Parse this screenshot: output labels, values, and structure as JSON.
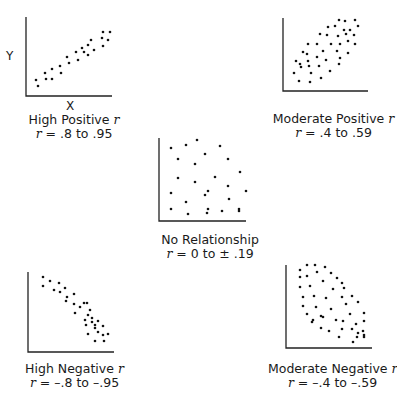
{
  "axis_labels": {
    "y": "Y",
    "x": "X"
  },
  "panels": [
    {
      "id": "high-positive",
      "title": "High Positive",
      "r_symbol": "r",
      "range_prefix": "r",
      "range_text": "=  .8 to .95"
    },
    {
      "id": "moderate-positive",
      "title": "Moderate Positive",
      "r_symbol": "r",
      "range_prefix": "r",
      "range_text": "=  .4 to .59"
    },
    {
      "id": "no-relationship",
      "title": "No Relationship",
      "r_symbol": "",
      "range_prefix": "r",
      "range_text": "=  0 to ± .19"
    },
    {
      "id": "high-negative",
      "title": "High Negative",
      "r_symbol": "r",
      "range_prefix": "r",
      "range_text": "=  –.8 to –.95"
    },
    {
      "id": "moderate-negative",
      "title": "Moderate Negative",
      "r_symbol": "r",
      "range_prefix": "r",
      "range_text": "=  –.4 to –.59"
    }
  ],
  "chart_data": [
    {
      "type": "scatter",
      "title": "High Positive r",
      "subtitle": "r = .8 to .95",
      "xlabel": "X",
      "ylabel": "Y",
      "grid": false,
      "axes": {
        "x0": 26,
        "y0": 96,
        "top": 17,
        "right": 112
      },
      "points": [
        [
          36,
          80
        ],
        [
          38,
          86
        ],
        [
          45,
          73
        ],
        [
          46,
          79
        ],
        [
          52,
          69
        ],
        [
          52,
          79
        ],
        [
          60,
          66
        ],
        [
          61,
          73
        ],
        [
          67,
          57
        ],
        [
          69,
          63
        ],
        [
          76,
          52
        ],
        [
          78,
          60
        ],
        [
          82,
          48
        ],
        [
          84,
          52
        ],
        [
          88,
          45
        ],
        [
          88,
          55
        ],
        [
          91,
          40
        ],
        [
          94,
          50
        ],
        [
          102,
          38
        ],
        [
          103,
          32
        ],
        [
          103,
          46
        ],
        [
          108,
          40
        ],
        [
          110,
          32
        ]
      ]
    },
    {
      "type": "scatter",
      "title": "Moderate Positive r",
      "subtitle": "r = .4 to .59",
      "xlabel": "",
      "ylabel": "",
      "grid": false,
      "axes": {
        "x0": 283,
        "y0": 91,
        "top": 18,
        "right": 368
      },
      "points": [
        [
          339,
          20
        ],
        [
          345,
          21
        ],
        [
          355,
          20
        ],
        [
          328,
          27
        ],
        [
          335,
          26
        ],
        [
          344,
          30
        ],
        [
          350,
          30
        ],
        [
          358,
          26
        ],
        [
          320,
          34
        ],
        [
          327,
          35
        ],
        [
          338,
          36
        ],
        [
          346,
          34
        ],
        [
          354,
          35
        ],
        [
          308,
          44
        ],
        [
          317,
          44
        ],
        [
          331,
          44
        ],
        [
          340,
          44
        ],
        [
          348,
          41
        ],
        [
          355,
          44
        ],
        [
          303,
          52
        ],
        [
          307,
          54
        ],
        [
          323,
          51
        ],
        [
          337,
          51
        ],
        [
          348,
          53
        ],
        [
          296,
          61
        ],
        [
          300,
          64
        ],
        [
          308,
          61
        ],
        [
          317,
          57
        ],
        [
          326,
          60
        ],
        [
          340,
          58
        ],
        [
          301,
          67
        ],
        [
          309,
          66
        ],
        [
          319,
          66
        ],
        [
          339,
          64
        ],
        [
          294,
          73
        ],
        [
          311,
          73
        ],
        [
          330,
          71
        ],
        [
          299,
          81
        ],
        [
          310,
          82
        ],
        [
          321,
          78
        ]
      ]
    },
    {
      "type": "scatter",
      "title": "No Relationship",
      "subtitle": "r = 0 to ± .19",
      "xlabel": "",
      "ylabel": "",
      "grid": false,
      "axes": {
        "x0": 159,
        "y0": 221,
        "top": 138,
        "right": 246
      },
      "points": [
        [
          197,
          140
        ],
        [
          186,
          145
        ],
        [
          171,
          148
        ],
        [
          220,
          146
        ],
        [
          205,
          154
        ],
        [
          178,
          159
        ],
        [
          228,
          159
        ],
        [
          195,
          164
        ],
        [
          240,
          172
        ],
        [
          178,
          178
        ],
        [
          215,
          177
        ],
        [
          195,
          182
        ],
        [
          228,
          186
        ],
        [
          208,
          191
        ],
        [
          246,
          191
        ],
        [
          171,
          193
        ],
        [
          205,
          195
        ],
        [
          229,
          199
        ],
        [
          186,
          202
        ],
        [
          171,
          209
        ],
        [
          208,
          209
        ],
        [
          239,
          209
        ],
        [
          188,
          214
        ],
        [
          207,
          213
        ],
        [
          222,
          211
        ],
        [
          239,
          211
        ]
      ]
    },
    {
      "type": "scatter",
      "title": "High Negative r",
      "subtitle": "r = –.8 to –.95",
      "xlabel": "",
      "ylabel": "",
      "grid": false,
      "axes": {
        "x0": 28,
        "y0": 352,
        "top": 272,
        "right": 114
      },
      "points": [
        [
          43,
          277
        ],
        [
          43,
          286
        ],
        [
          50,
          281
        ],
        [
          54,
          290
        ],
        [
          59,
          283
        ],
        [
          60,
          292
        ],
        [
          65,
          288
        ],
        [
          66,
          301
        ],
        [
          67,
          297
        ],
        [
          74,
          294
        ],
        [
          74,
          304
        ],
        [
          75,
          313
        ],
        [
          80,
          307
        ],
        [
          84,
          303
        ],
        [
          85,
          320
        ],
        [
          88,
          315
        ],
        [
          87,
          303
        ],
        [
          90,
          310
        ],
        [
          92,
          318
        ],
        [
          86,
          325
        ],
        [
          92,
          322
        ],
        [
          95,
          325
        ],
        [
          98,
          321
        ],
        [
          88,
          334
        ],
        [
          95,
          328
        ],
        [
          98,
          332
        ],
        [
          103,
          326
        ],
        [
          103,
          335
        ],
        [
          95,
          341
        ],
        [
          104,
          341
        ],
        [
          108,
          334
        ]
      ]
    },
    {
      "type": "scatter",
      "title": "Moderate Negative r",
      "subtitle": "r = –.4 to –.59",
      "xlabel": "",
      "ylabel": "",
      "grid": false,
      "axes": {
        "x0": 286,
        "y0": 348,
        "top": 265,
        "right": 372
      },
      "points": [
        [
          307,
          265
        ],
        [
          315,
          265
        ],
        [
          325,
          267
        ],
        [
          300,
          270
        ],
        [
          317,
          272
        ],
        [
          331,
          273
        ],
        [
          300,
          277
        ],
        [
          307,
          276
        ],
        [
          323,
          281
        ],
        [
          337,
          278
        ],
        [
          342,
          283
        ],
        [
          300,
          287
        ],
        [
          310,
          286
        ],
        [
          333,
          289
        ],
        [
          344,
          288
        ],
        [
          303,
          297
        ],
        [
          314,
          296
        ],
        [
          326,
          298
        ],
        [
          342,
          297
        ],
        [
          352,
          296
        ],
        [
          303,
          306
        ],
        [
          316,
          307
        ],
        [
          331,
          309
        ],
        [
          346,
          304
        ],
        [
          358,
          302
        ],
        [
          307,
          314
        ],
        [
          312,
          322
        ],
        [
          323,
          317
        ],
        [
          336,
          320
        ],
        [
          350,
          314
        ],
        [
          364,
          313
        ],
        [
          313,
          320
        ],
        [
          321,
          316
        ],
        [
          343,
          321
        ],
        [
          356,
          324
        ],
        [
          364,
          321
        ],
        [
          321,
          328
        ],
        [
          329,
          331
        ],
        [
          342,
          329
        ],
        [
          352,
          329
        ],
        [
          363,
          331
        ],
        [
          358,
          333
        ],
        [
          339,
          337
        ],
        [
          357,
          337
        ],
        [
          364,
          335
        ],
        [
          353,
          342
        ],
        [
          364,
          337
        ]
      ]
    }
  ]
}
